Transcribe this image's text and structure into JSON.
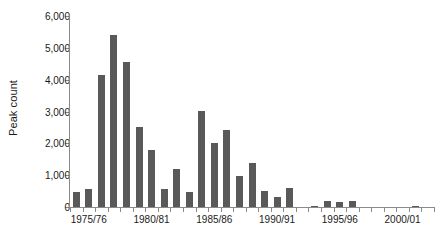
{
  "chart_data": {
    "type": "bar",
    "title": "",
    "subtitle": "",
    "xlabel": "",
    "ylabel": "Peak count",
    "ylim": [
      0,
      6000
    ],
    "y_ticks": [
      0,
      1000,
      2000,
      3000,
      4000,
      5000,
      6000
    ],
    "y_tick_labels": [
      "0",
      "1,000",
      "2,000",
      "3,000",
      "4,000",
      "5,000",
      "6,000"
    ],
    "grid": false,
    "legend": null,
    "bar_color": "#595959",
    "axis_color": "#8a8a8a",
    "text_color": "#1a1a1a",
    "categories": [
      "1974/75",
      "1975/76",
      "1976/77",
      "1977/78",
      "1978/79",
      "1979/80",
      "1980/81",
      "1981/82",
      "1982/83",
      "1983/84",
      "1984/85",
      "1985/86",
      "1986/87",
      "1987/88",
      "1988/89",
      "1989/90",
      "1990/91",
      "1991/92",
      "1992/93",
      "1993/94",
      "1994/95",
      "1995/96",
      "1996/97",
      "1997/98",
      "1998/99",
      "1999/00",
      "2000/01",
      "2001/02",
      "2002/03"
    ],
    "values": [
      480,
      580,
      4150,
      5400,
      4550,
      2510,
      1790,
      580,
      1180,
      480,
      3020,
      2000,
      2420,
      980,
      1390,
      500,
      300,
      590,
      0,
      30,
      200,
      160,
      200,
      0,
      0,
      0,
      0,
      40,
      0
    ],
    "labelled_categories": [
      {
        "category": "1975/76",
        "index": 1
      },
      {
        "category": "1980/81",
        "index": 6
      },
      {
        "category": "1985/86",
        "index": 11
      },
      {
        "category": "1990/91",
        "index": 16
      },
      {
        "category": "1995/96",
        "index": 21
      },
      {
        "category": "2000/01",
        "index": 26
      }
    ]
  }
}
